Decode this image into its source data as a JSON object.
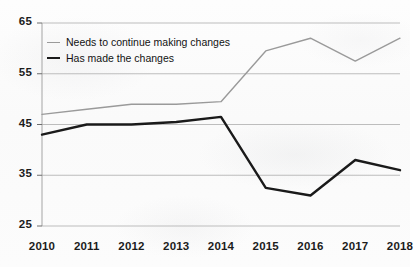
{
  "chart_data": {
    "type": "line",
    "title": "",
    "subtitle": "",
    "xlabel": "",
    "ylabel": "",
    "categories": [
      "2010",
      "2011",
      "2012",
      "2013",
      "2014",
      "2015",
      "2016",
      "2017",
      "2018"
    ],
    "series": [
      {
        "name": "Needs to continue making changes",
        "color": "#9a9a9a",
        "values": [
          47,
          48,
          49,
          49,
          49.5,
          59.5,
          62,
          57.5,
          62
        ]
      },
      {
        "name": "Has made the changes",
        "color": "#1a1a1a",
        "values": [
          43,
          45,
          45,
          45.5,
          46.5,
          32.5,
          31,
          38,
          36
        ]
      }
    ],
    "ylim": [
      25,
      65
    ],
    "yticks": [
      25,
      35,
      45,
      55,
      65
    ],
    "ytick_labels": [
      "25",
      "35",
      "45",
      "55",
      "65"
    ],
    "xtick_labels": [
      "2010",
      "2011",
      "2012",
      "2013",
      "2014",
      "2015",
      "2016",
      "2017",
      "2018"
    ],
    "grid": true,
    "grid_color": "#b6b6b6",
    "legend_position": "top-left"
  },
  "legend": {
    "items": [
      {
        "label": "Needs to continue making changes"
      },
      {
        "label": "Has made the changes"
      }
    ]
  }
}
